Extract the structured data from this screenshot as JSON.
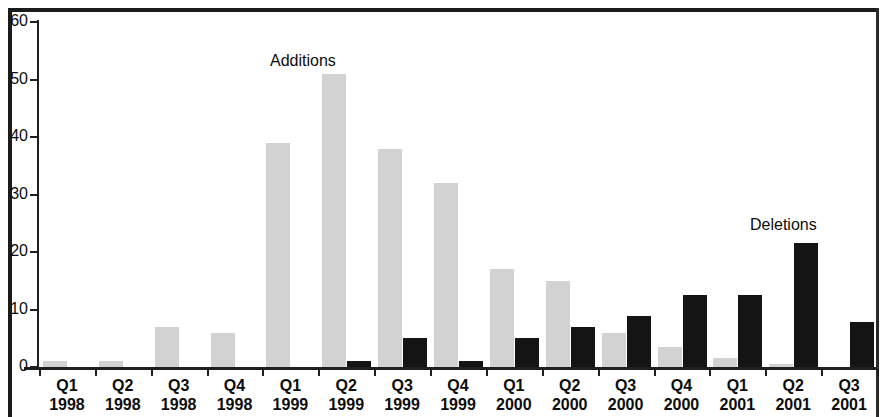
{
  "chart_data": {
    "type": "bar",
    "title": "",
    "xlabel": "",
    "ylabel": "",
    "ylim": [
      0,
      60
    ],
    "yticks": [
      0,
      10,
      20,
      30,
      40,
      50,
      60
    ],
    "grid": false,
    "legend_position": "in-plot-annotations",
    "categories": [
      "Q1 1998",
      "Q2 1998",
      "Q3 1998",
      "Q4 1998",
      "Q1 1999",
      "Q2 1999",
      "Q3 1999",
      "Q4 1999",
      "Q1 2000",
      "Q2 2000",
      "Q3 2000",
      "Q4 2000",
      "Q1 2001",
      "Q2 2001",
      "Q3 2001"
    ],
    "quarters": [
      "Q1",
      "Q2",
      "Q3",
      "Q4",
      "Q1",
      "Q2",
      "Q3",
      "Q4",
      "Q1",
      "Q2",
      "Q3",
      "Q4",
      "Q1",
      "Q2",
      "Q3"
    ],
    "years": [
      "1998",
      "1998",
      "1998",
      "1998",
      "1999",
      "1999",
      "1999",
      "1999",
      "2000",
      "2000",
      "2000",
      "2000",
      "2001",
      "2001",
      "2001"
    ],
    "series": [
      {
        "name": "Additions",
        "color": "#d2d2d2",
        "values": [
          1,
          1,
          7,
          6,
          39,
          51,
          38,
          32,
          17,
          15,
          6,
          3.5,
          1.5,
          0.5,
          0
        ]
      },
      {
        "name": "Deletions",
        "color": "#141414",
        "values": [
          0,
          0,
          0,
          0,
          0,
          1,
          5,
          1,
          5,
          7,
          8.8,
          12.5,
          12.5,
          21.5,
          7.8
        ]
      }
    ],
    "annotations": [
      {
        "text": "Additions",
        "target": "Q2 1999",
        "series": "Additions"
      },
      {
        "text": "Deletions",
        "target": "Q2 2001",
        "series": "Deletions"
      }
    ]
  }
}
